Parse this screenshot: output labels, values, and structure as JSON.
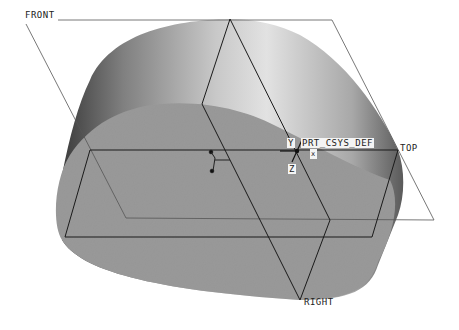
{
  "viewport": {
    "name": "3D model viewport",
    "background": "#ffffff",
    "model": {
      "top_face_color": "#9a9a9a",
      "side_gradient": [
        "#505050",
        "#8a8a8a",
        "#dcdcdc",
        "#b0b0b0",
        "#6a6a6a"
      ]
    },
    "datum_planes": [
      {
        "id": "front",
        "label": "FRONT"
      },
      {
        "id": "right",
        "label": "RIGHT"
      },
      {
        "id": "top",
        "label": "TOP"
      }
    ],
    "csys": {
      "label": "PRT_CSYS_DEF",
      "axes": {
        "y": "Y",
        "z": "Z",
        "x": "x"
      }
    },
    "colors": {
      "datum_line_front": "#555555",
      "datum_line_dark": "#1a1a1a"
    }
  }
}
